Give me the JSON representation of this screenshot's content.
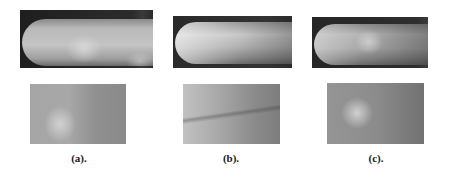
{
  "figure": {
    "panels": [
      {
        "id": "a",
        "caption": "(a).",
        "top_image": "finger-vein-full-image-a",
        "bottom_image": "finger-vein-roi-a"
      },
      {
        "id": "b",
        "caption": "(b).",
        "top_image": "finger-vein-full-image-b",
        "bottom_image": "finger-vein-roi-b"
      },
      {
        "id": "c",
        "caption": "(c).",
        "top_image": "finger-vein-full-image-c",
        "bottom_image": "finger-vein-roi-c"
      }
    ]
  }
}
